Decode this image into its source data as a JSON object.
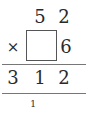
{
  "problem": {
    "multiplicand": [
      "5",
      "2"
    ],
    "operator": "×",
    "multiplier_blank": "",
    "multiplier_ones": "6",
    "product": [
      "3",
      "1",
      "2"
    ],
    "carry": "1"
  }
}
